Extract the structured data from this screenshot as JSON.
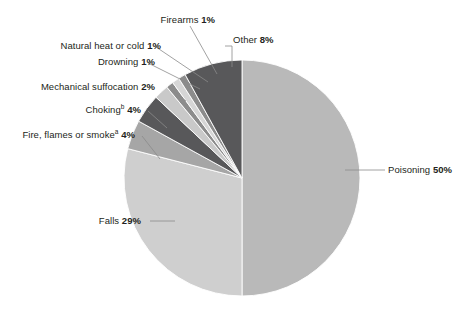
{
  "chart_data": {
    "type": "pie",
    "title": "",
    "subtitle": "",
    "xlabel": "",
    "ylabel": "",
    "legend_position": "none",
    "grid": false,
    "units": "percent",
    "start_angle_deg": 0,
    "direction": "clockwise",
    "categories": [
      "Poisoning",
      "Falls",
      "Fire, flames or smoke",
      "Choking",
      "Mechanical suffocation",
      "Drowning",
      "Natural heat or cold",
      "Firearms",
      "Other"
    ],
    "values": [
      50,
      29,
      4,
      4,
      2,
      1,
      1,
      1,
      8
    ],
    "slices": [
      {
        "name": "Poisoning",
        "value": 50,
        "pct_text": "50%",
        "color": "#b9b9b9",
        "superscript": ""
      },
      {
        "name": "Falls",
        "value": 29,
        "pct_text": "29%",
        "color": "#cfcfcf",
        "superscript": ""
      },
      {
        "name": "Fire, flames or smoke",
        "value": 4,
        "pct_text": "4%",
        "color": "#a6a6a6",
        "superscript": "a"
      },
      {
        "name": "Choking",
        "value": 4,
        "pct_text": "4%",
        "color": "#58585a",
        "superscript": "b"
      },
      {
        "name": "Mechanical suffocation",
        "value": 2,
        "pct_text": "2%",
        "color": "#c9c9c9",
        "superscript": ""
      },
      {
        "name": "Drowning",
        "value": 1,
        "pct_text": "1%",
        "color": "#8c8c8c",
        "superscript": ""
      },
      {
        "name": "Natural heat or cold",
        "value": 1,
        "pct_text": "1%",
        "color": "#d6d6d6",
        "superscript": ""
      },
      {
        "name": "Firearms",
        "value": 1,
        "pct_text": "1%",
        "color": "#8c8c8c",
        "superscript": ""
      },
      {
        "name": "Other",
        "value": 8,
        "pct_text": "8%",
        "color": "#58585a",
        "superscript": ""
      }
    ]
  },
  "labels": {
    "poisoning": {
      "text": "Poisoning",
      "pct": "50%",
      "sup": ""
    },
    "falls": {
      "text": "Falls",
      "pct": "29%",
      "sup": ""
    },
    "fire": {
      "text": "Fire, flames or smoke",
      "pct": "4%",
      "sup": "a"
    },
    "choking": {
      "text": "Choking",
      "pct": "4%",
      "sup": "b"
    },
    "mechanical": {
      "text": "Mechanical suffocation",
      "pct": "2%",
      "sup": ""
    },
    "drowning": {
      "text": "Drowning",
      "pct": "1%",
      "sup": ""
    },
    "natural": {
      "text": "Natural heat or cold",
      "pct": "1%",
      "sup": ""
    },
    "firearms": {
      "text": "Firearms",
      "pct": "1%",
      "sup": ""
    },
    "other": {
      "text": "Other",
      "pct": "8%",
      "sup": ""
    }
  },
  "style": {
    "background": "#ffffff",
    "text_color": "#231f20",
    "leader_color": "#8a8a8a"
  }
}
